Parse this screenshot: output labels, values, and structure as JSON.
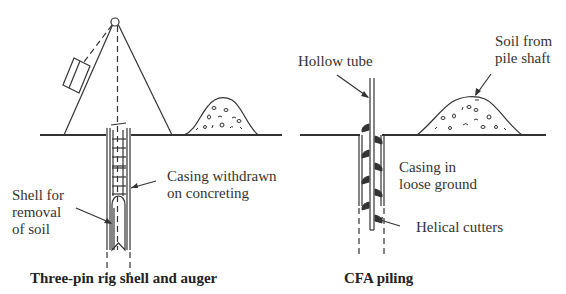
{
  "left_figure": {
    "caption": "Three-pin rig shell and auger",
    "labels": {
      "casing_line1": "Casing withdrawn",
      "casing_line2": "on concreting",
      "shell_line1": "Shell for",
      "shell_line2": "removal",
      "shell_line3": "of soil"
    }
  },
  "right_figure": {
    "caption": "CFA piling",
    "labels": {
      "tube": "Hollow tube",
      "soil_line1": "Soil from",
      "soil_line2": "pile shaft",
      "casing_line1": "Casing in",
      "casing_line2": "loose ground",
      "cutters": "Helical cutters"
    }
  },
  "colors": {
    "line": "#333333",
    "background": "#ffffff"
  }
}
